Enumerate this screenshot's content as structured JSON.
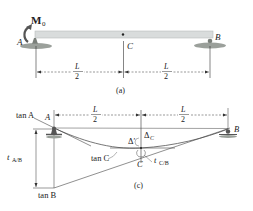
{
  "figure_a": {
    "moment_label": "M",
    "moment_sub": "0",
    "point_a": "A",
    "point_b": "B",
    "point_c": "C",
    "dim_left_num": "L",
    "dim_left_den": "2",
    "dim_right_num": "L",
    "dim_right_den": "2",
    "caption": "(a)"
  },
  "figure_c": {
    "tan_a": "tan A",
    "tan_b": "tan B",
    "tan_c": "tan C",
    "point_a": "A",
    "point_b": "B",
    "point_c": "C",
    "delta_prime": "Δ′",
    "delta_c": "Δ",
    "delta_c_sub": "C",
    "t_ab": "t",
    "t_ab_sub": "A/B",
    "t_cb": "t",
    "t_cb_sub": "C/B",
    "dim_left_num": "L",
    "dim_left_den": "2",
    "dim_right_num": "L",
    "dim_right_den": "2",
    "caption": "(c)"
  },
  "colors": {
    "beam": "#d9dcdc",
    "beam_edge": "#b8bcbc",
    "ground": "#8a8f8a",
    "line": "#333333",
    "curve": "#666666"
  }
}
